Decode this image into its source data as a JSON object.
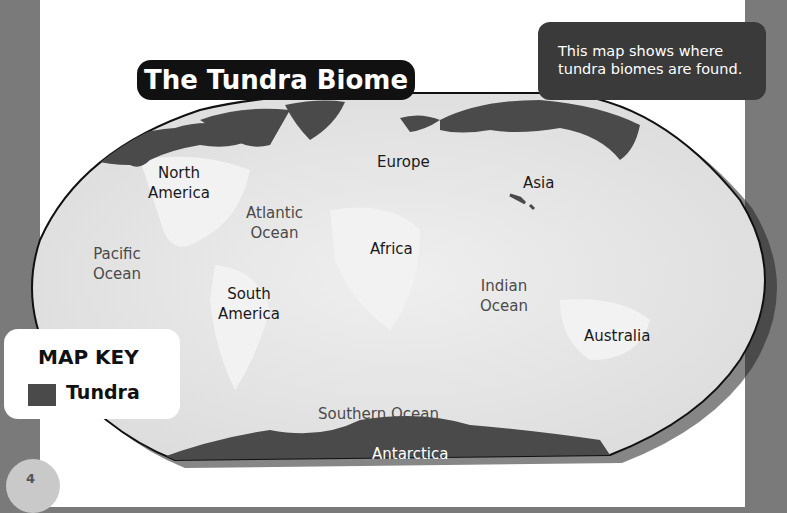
{
  "title": "The Tundra Biome",
  "info_box": {
    "line1": "This map shows where",
    "line2": "tundra biomes are found."
  },
  "map_labels": {
    "continents": {
      "north_america": [
        "North",
        "America"
      ],
      "europe": "Europe",
      "asia": "Asia",
      "africa": "Africa",
      "south_america": [
        "South",
        "America"
      ],
      "australia": "Australia",
      "antarctica": "Antarctica"
    },
    "oceans": {
      "atlantic": [
        "Atlantic",
        "Ocean"
      ],
      "pacific": [
        "Pacific",
        "Ocean"
      ],
      "indian": [
        "Indian",
        "Ocean"
      ],
      "southern": "Southern Ocean"
    }
  },
  "map_key": {
    "title": "MAP KEY",
    "items": [
      {
        "label": "Tundra",
        "color": "#4a4a4a"
      }
    ]
  },
  "page_number": "4",
  "colors": {
    "tundra": "#4a4a4a",
    "land_ocean": "#e6e6e6",
    "title_bg": "#111111",
    "info_bg": "#3a3a3a"
  }
}
